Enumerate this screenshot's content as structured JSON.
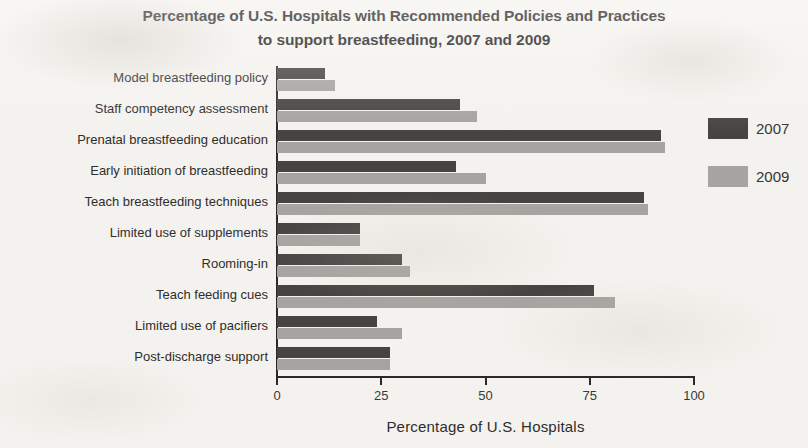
{
  "chart_data": {
    "type": "bar",
    "orientation": "horizontal",
    "title": "Percentage of U.S. Hospitals with Recommended Policies and Practices to support breastfeeding, 2007 and 2009",
    "title_line1": "Percentage of U.S. Hospitals with Recommended Policies and Practices",
    "title_line2": "to support breastfeeding, 2007 and 2009",
    "xlabel": "Percentage of U.S. Hospitals",
    "ylabel": "",
    "xlim": [
      0,
      100
    ],
    "xticks": [
      0,
      25,
      50,
      75,
      100
    ],
    "xtick_labels": [
      "0",
      "25",
      "50",
      "75",
      "100"
    ],
    "grid": false,
    "legend_position": "right",
    "categories": [
      "Model breastfeeding policy",
      "Staff competency assessment",
      "Prenatal breastfeeding education",
      "Early initiation of breastfeeding",
      "Teach breastfeeding techniques",
      "Limited use of supplements",
      "Rooming-in",
      "Teach feeding cues",
      "Limited use of pacifiers",
      "Post-discharge support"
    ],
    "series": [
      {
        "name": "2007",
        "color": "#454442",
        "values": [
          11.5,
          44,
          92,
          43,
          88,
          20,
          30,
          76,
          24,
          27
        ]
      },
      {
        "name": "2009",
        "color": "#a5a4a0",
        "values": [
          14,
          48,
          93,
          50,
          89,
          20,
          32,
          81,
          30,
          27
        ]
      }
    ]
  },
  "legend": {
    "entries": [
      {
        "label": "2007"
      },
      {
        "label": "2009"
      }
    ]
  }
}
